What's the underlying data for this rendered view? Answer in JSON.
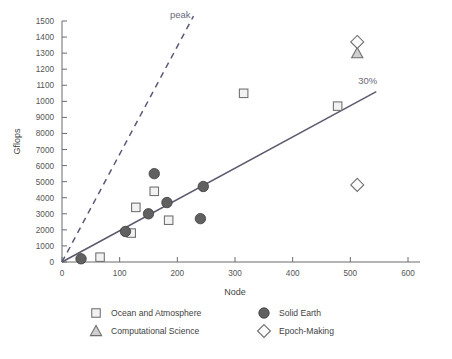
{
  "chart_data": {
    "type": "scatter",
    "title": "",
    "xlabel": "Node",
    "ylabel": "Gflops",
    "xlim": [
      0,
      600
    ],
    "ylim": [
      0,
      15000
    ],
    "grid": false,
    "legend_position": "bottom",
    "xticks": [
      "0",
      "100",
      "200",
      "300",
      "400",
      "500",
      "600"
    ],
    "xtick_values": [
      0,
      100,
      200,
      300,
      400,
      500,
      600
    ],
    "yticks": [
      "0",
      "1000",
      "2000",
      "3000",
      "4000",
      "5000",
      "6000",
      "7000",
      "8000",
      "9000",
      "1000",
      "1100",
      "1200",
      "1300",
      "1400",
      "1500"
    ],
    "ytick_values": [
      0,
      1000,
      2000,
      3000,
      4000,
      5000,
      6000,
      7000,
      8000,
      9000,
      10000,
      11000,
      12000,
      13000,
      14000,
      15000
    ],
    "annotations": [
      {
        "text": "peak",
        "x": 205,
        "y": 15200
      },
      {
        "text": "30%",
        "x": 530,
        "y": 11100
      }
    ],
    "reference_lines": [
      {
        "name": "peak",
        "style": "dashed",
        "x": [
          0,
          228
        ],
        "y": [
          0,
          15300
        ],
        "color": "#5a5a78"
      },
      {
        "name": "30%",
        "style": "solid",
        "x": [
          0,
          545
        ],
        "y": [
          0,
          10600
        ],
        "color": "#5a5a6e"
      }
    ],
    "series": [
      {
        "name": "Ocean and Atmosphere",
        "marker": "square",
        "points": [
          {
            "x": 66,
            "y": 300
          },
          {
            "x": 120,
            "y": 1800
          },
          {
            "x": 128,
            "y": 3400
          },
          {
            "x": 160,
            "y": 4400
          },
          {
            "x": 185,
            "y": 2600
          },
          {
            "x": 315,
            "y": 10500
          },
          {
            "x": 478,
            "y": 9700
          }
        ]
      },
      {
        "name": "Solid Earth",
        "marker": "circle",
        "points": [
          {
            "x": 33,
            "y": 200
          },
          {
            "x": 110,
            "y": 1900
          },
          {
            "x": 150,
            "y": 3000
          },
          {
            "x": 160,
            "y": 5500
          },
          {
            "x": 182,
            "y": 3700
          },
          {
            "x": 240,
            "y": 2700
          },
          {
            "x": 245,
            "y": 4700
          }
        ]
      },
      {
        "name": "Computational Science",
        "marker": "triangle",
        "points": [
          {
            "x": 512,
            "y": 13000
          }
        ]
      },
      {
        "name": "Epoch-Making",
        "marker": "diamond",
        "points": [
          {
            "x": 512,
            "y": 13700
          },
          {
            "x": 512,
            "y": 4800
          }
        ]
      }
    ]
  },
  "legend": {
    "items": [
      {
        "label": "Ocean and Atmosphere",
        "marker": "square"
      },
      {
        "label": "Solid Earth",
        "marker": "circle"
      },
      {
        "label": "Computational Science",
        "marker": "triangle"
      },
      {
        "label": "Epoch-Making",
        "marker": "diamond"
      }
    ]
  }
}
